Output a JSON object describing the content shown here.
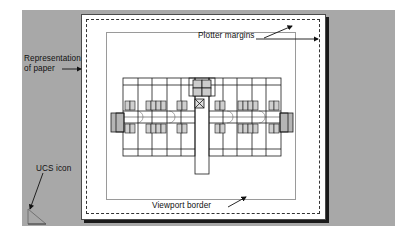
{
  "figure": {
    "type": "cad-paper-space-layout-diagram",
    "colors": {
      "background_frame": "#a8a8a8",
      "paper": "#ffffff",
      "paper_shadow": "#1a1a1a",
      "plotter_margin_line": "#333333",
      "viewport_border": "#9a9a9a",
      "grid_dot": "#b9b9b9",
      "plan_line": "#1a1a1a",
      "label_text": "#111111"
    }
  },
  "labels": {
    "representation_of_paper": "Representation\nof paper",
    "ucs_icon": "UCS icon",
    "plotter_margins": "Plotter margins",
    "viewport_border": "Viewport border"
  },
  "icons": {
    "ucs": "ucs-axis-triangle-icon",
    "arrow_paper": "leader-arrow-right",
    "arrow_ucs": "leader-arrow-down-left",
    "arrow_plotter_up": "leader-arrow-up-right",
    "arrow_plotter_right": "leader-arrow-right",
    "arrow_viewport": "leader-arrow-up-right"
  },
  "floorplan": {
    "title": "apartment-building-floor-plan",
    "description": "Symmetrical multi-unit residential floor plan with central stair/elevator core, double-loaded corridor and plumbing fixture groups",
    "bays_left": 4,
    "bays_right": 4,
    "corridor": "central horizontal double-loaded corridor",
    "core": "central stair and elevator core",
    "end_projections": 2
  },
  "grid": {
    "spacing_px": 10,
    "visible": true
  }
}
